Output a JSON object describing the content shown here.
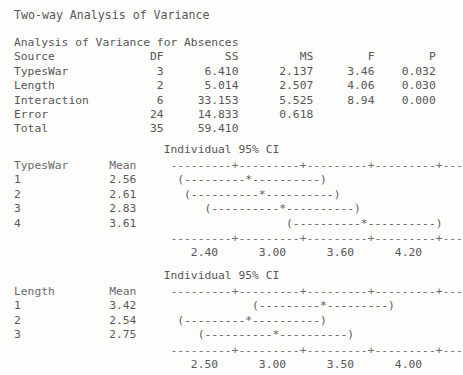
{
  "document": {
    "title": "Two-way Analysis of Variance",
    "font": "monospace",
    "background_color": "#fdfdfb",
    "text_color": "#57575a"
  },
  "anova": {
    "caption": "Analysis of Variance for Absences",
    "columns": [
      "Source",
      "DF",
      "SS",
      "MS",
      "F",
      "P"
    ],
    "header_line": "Source              DF         SS         MS        F        P",
    "rows": [
      {
        "source": "TypesWar",
        "df": "3",
        "ss": "6.410",
        "ms": "2.137",
        "f": "3.46",
        "p": "0.032",
        "line": "TypesWar             3      6.410      2.137     3.46    0.032"
      },
      {
        "source": "Length",
        "df": "2",
        "ss": "5.014",
        "ms": "2.507",
        "f": "4.06",
        "p": "0.030",
        "line": "Length               2      5.014      2.507     4.06    0.030"
      },
      {
        "source": "Interaction",
        "df": "6",
        "ss": "33.153",
        "ms": "5.525",
        "f": "8.94",
        "p": "0.000",
        "line": "Interaction          6     33.153      5.525     8.94    0.000"
      },
      {
        "source": "Error",
        "df": "24",
        "ss": "14.833",
        "ms": "0.618",
        "f": "",
        "p": "",
        "line": "Error               24     14.833      0.618"
      },
      {
        "source": "Total",
        "df": "35",
        "ss": "59.410",
        "ms": "",
        "f": "",
        "p": "",
        "line": "Total               35     59.410"
      }
    ]
  },
  "ci_plot_typeswar": {
    "ci_heading": "Individual 95% CI",
    "ci_heading_line": "                      Individual 95% CI",
    "factor_label": "TypesWar",
    "mean_label": "Mean",
    "header_line": "TypesWar      Mean     ---------+---------+---------+---------+---",
    "axis_line": "                       ---------+---------+---------+---------+---",
    "tick_label_line": "                          2.40      3.00      3.60      4.20",
    "ticks": [
      "2.40",
      "3.00",
      "3.60",
      "4.20"
    ],
    "rows": [
      {
        "level": "1",
        "mean": "2.56",
        "line": "1             2.56      (---------*----------)"
      },
      {
        "level": "2",
        "mean": "2.61",
        "line": "2             2.61       (----------*----------)"
      },
      {
        "level": "3",
        "mean": "2.83",
        "line": "3             2.83          (----------*----------)"
      },
      {
        "level": "4",
        "mean": "3.61",
        "line": "4             3.61                      (----------*----------)"
      }
    ]
  },
  "ci_plot_length": {
    "ci_heading": "Individual 95% CI",
    "ci_heading_line": "                      Individual 95% CI",
    "factor_label": "Length",
    "mean_label": "Mean",
    "header_line": "Length        Mean     ---------+---------+---------+---------+---",
    "axis_line": "                       ---------+---------+---------+---------+---",
    "tick_label_line": "                          2.50      3.00      3.50      4.00",
    "ticks": [
      "2.50",
      "3.00",
      "3.50",
      "4.00"
    ],
    "rows": [
      {
        "level": "1",
        "mean": "3.42",
        "line": "1             3.42                 (---------*---------)"
      },
      {
        "level": "2",
        "mean": "2.54",
        "line": "2             2.54      (---------*----------)"
      },
      {
        "level": "3",
        "mean": "2.75",
        "line": "3             2.75         (----------*----------)"
      }
    ]
  }
}
